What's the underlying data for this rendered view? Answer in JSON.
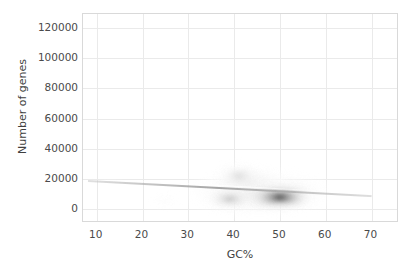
{
  "chart_data": {
    "type": "heatmap",
    "subtype": "2d-kernel-density-contour",
    "title": "",
    "xlabel": "GC%",
    "ylabel": "Number of genes",
    "xlim": [
      7,
      76
    ],
    "ylim": [
      -9000,
      129000
    ],
    "xticks": [
      10,
      20,
      30,
      40,
      50,
      60,
      70
    ],
    "xtick_labels": [
      "10",
      "20",
      "30",
      "40",
      "50",
      "60",
      "70"
    ],
    "yticks": [
      0,
      20000,
      40000,
      60000,
      80000,
      100000,
      120000
    ],
    "ytick_labels": [
      "0",
      "20000",
      "40000",
      "60000",
      "80000",
      "100000",
      "120000"
    ],
    "grid": true,
    "legend": null,
    "colormap": "greyscale",
    "background": "#ffffff",
    "gridline_color": "#eaeaea",
    "border_color": "#d9d9d9",
    "density_modes": [
      {
        "name": "primary-mode",
        "gc": 50.0,
        "genes": 8000,
        "peak_intensity": 1.0,
        "note": "darkest core, horizontally elongated"
      },
      {
        "name": "secondary-mode",
        "gc": 39.0,
        "genes": 7000,
        "peak_intensity": 0.42,
        "note": "medium grey lobe left of primary"
      },
      {
        "name": "tertiary-mode",
        "gc": 41.0,
        "genes": 22000,
        "peak_intensity": 0.22,
        "note": "faint upper lobe"
      },
      {
        "name": "faint-wisp",
        "gc": 25.0,
        "genes": 6000,
        "peak_intensity": 0.05,
        "note": "isolated low-density wisp"
      }
    ],
    "ridge_line": {
      "label": "faint diagonal ridge",
      "x_start": 8,
      "y_start": 19500,
      "x_end": 70,
      "y_end": 9500
    },
    "envelope": {
      "gc_min": 22,
      "gc_max": 62,
      "genes_min": 0,
      "genes_max": 33000
    }
  }
}
